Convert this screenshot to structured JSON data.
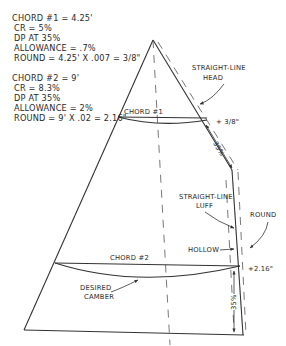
{
  "notes": {
    "chord1": {
      "lines": [
        "CHORD #1 = 4.25'",
        "CR = 5%",
        "DP AT 35%",
        "ALLOWANCE = .7%",
        "ROUND = 4.25' X .007 = 3/8\""
      ]
    },
    "chord2": {
      "lines": [
        "CHORD #2 = 9'",
        "CR = 8.3%",
        "DP AT 35%",
        "ALLOWANCE = 2%",
        "ROUND = 9' X .02 = 2.16\""
      ]
    }
  },
  "labels": {
    "straight_line_head_1": "STRAIGHT-LINE",
    "straight_line_head_2": "HEAD",
    "chord1": "CHORD #1",
    "plus_3_8": "+ 3/8\"",
    "pct_35_upper": "35%",
    "straight_line_luff_1": "STRAIGHT-LINE",
    "straight_line_luff_2": "LUFF",
    "round": "ROUND",
    "hollow": "HOLLOW",
    "chord2": "CHORD #2",
    "plus_2_16": "+2.16\"",
    "desired_camber_1": "DESIRED",
    "desired_camber_2": "CAMBER",
    "pct_35_lower": "35%"
  }
}
